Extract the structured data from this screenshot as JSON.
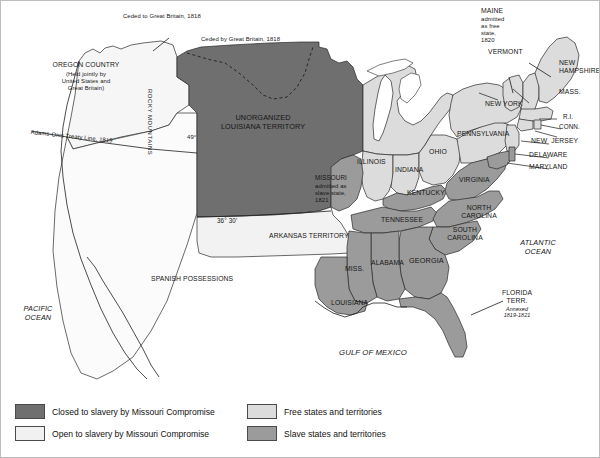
{
  "map": {
    "title": "The Missouri Compromise, 1820",
    "colors": {
      "closed_to_slavery": "#6f6f6f",
      "open_to_slavery": "#f1f1f1",
      "free_states": "#dcdcdc",
      "slave_states": "#9b9b9b",
      "water": "#ffffff",
      "outline": "#2a2a2a",
      "text": "#161616"
    },
    "annotations": [
      {
        "id": "ceded-to-gb",
        "text": "Ceded to Great Britain, 1818"
      },
      {
        "id": "ceded-by-gb",
        "text": "Ceded by Great Britain, 1818"
      },
      {
        "id": "adams-onis",
        "text": "Adams-Onis Treaty Line, 1819"
      },
      {
        "id": "parallel-49",
        "text": "49°"
      },
      {
        "id": "parallel-3630",
        "text": "36° 30'"
      }
    ],
    "regions": [
      {
        "id": "oregon-country",
        "name": "OREGON COUNTRY",
        "note": "(Held jointly by\nUnited States and\nGreat Britain)",
        "fill": "open_to_slavery"
      },
      {
        "id": "unorganized-louisiana",
        "name": "UNORGANIZED\nLOUISIANA TERRITORY",
        "fill": "closed_to_slavery"
      },
      {
        "id": "arkansas-territory",
        "name": "ARKANSAS TERRITORY",
        "fill": "open_to_slavery"
      },
      {
        "id": "spanish-possessions",
        "name": "SPANISH POSSESSIONS",
        "fill": "open_to_slavery"
      },
      {
        "id": "florida-territory",
        "name": "FLORIDA\nTERR.",
        "note": "Annexed\n1819-1821",
        "fill": "slave_states"
      },
      {
        "id": "rocky-mountains",
        "name": "ROCKY MOUNTAINS",
        "fill": "closed_to_slavery"
      }
    ],
    "states": [
      {
        "id": "maine",
        "label": "MAINE",
        "note": "admitted\nas free\nstate,\n1820",
        "status": "free_states"
      },
      {
        "id": "vermont",
        "label": "VERMONT",
        "status": "free_states"
      },
      {
        "id": "new-hampshire",
        "label": "NEW\nHAMPSHIRE",
        "status": "free_states"
      },
      {
        "id": "massachusetts",
        "label": "MASS.",
        "status": "free_states"
      },
      {
        "id": "rhode-island",
        "label": "R.I.",
        "status": "free_states"
      },
      {
        "id": "connecticut",
        "label": "CONN.",
        "status": "free_states"
      },
      {
        "id": "new-york",
        "label": "NEW YORK",
        "status": "free_states"
      },
      {
        "id": "new-jersey",
        "label": "NEW  JERSEY",
        "status": "free_states"
      },
      {
        "id": "pennsylvania",
        "label": "PENNSYLVANIA",
        "status": "free_states"
      },
      {
        "id": "delaware",
        "label": "DELAWARE",
        "status": "slave_states"
      },
      {
        "id": "maryland",
        "label": "MARYLAND",
        "status": "slave_states"
      },
      {
        "id": "ohio",
        "label": "OHIO",
        "status": "free_states"
      },
      {
        "id": "indiana",
        "label": "INDIANA",
        "status": "free_states"
      },
      {
        "id": "illinois",
        "label": "ILLINOIS",
        "status": "free_states"
      },
      {
        "id": "missouri",
        "label": "MISSOURI",
        "note": "admitted as\nslave state,\n1821",
        "status": "slave_states"
      },
      {
        "id": "kentucky",
        "label": "KENTUCKY",
        "status": "slave_states"
      },
      {
        "id": "virginia",
        "label": "VIRGINIA",
        "status": "slave_states"
      },
      {
        "id": "north-carolina",
        "label": "NORTH\nCAROLINA",
        "status": "slave_states"
      },
      {
        "id": "south-carolina",
        "label": "SOUTH\nCAROLINA",
        "status": "slave_states"
      },
      {
        "id": "tennessee",
        "label": "TENNESSEE",
        "status": "slave_states"
      },
      {
        "id": "georgia",
        "label": "GEORGIA",
        "status": "slave_states"
      },
      {
        "id": "alabama",
        "label": "ALABAMA",
        "status": "slave_states"
      },
      {
        "id": "mississippi",
        "label": "MISS.",
        "status": "slave_states"
      },
      {
        "id": "louisiana",
        "label": "LOUISIANA",
        "status": "slave_states"
      }
    ],
    "water_labels": [
      {
        "id": "pacific-ocean",
        "text": "PACIFIC\nOCEAN"
      },
      {
        "id": "atlantic-ocean",
        "text": "ATLANTIC\nOCEAN"
      },
      {
        "id": "gulf-of-mexico",
        "text": "GULF OF MEXICO"
      }
    ]
  },
  "legend": {
    "items": [
      {
        "id": "closed-to-slavery",
        "label": "Closed to slavery by Missouri Compromise",
        "color": "#6f6f6f"
      },
      {
        "id": "open-to-slavery",
        "label": "Open to slavery by Missouri Compromise",
        "color": "#f1f1f1"
      },
      {
        "id": "free-states",
        "label": "Free states and territories",
        "color": "#dcdcdc"
      },
      {
        "id": "slave-states",
        "label": "Slave states and territories",
        "color": "#9b9b9b"
      }
    ]
  }
}
